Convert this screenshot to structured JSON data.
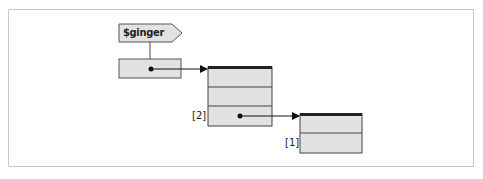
{
  "diagram": {
    "variable": {
      "label": "$ginger"
    },
    "arrays": [
      {
        "name": "outer-array",
        "rows": 3,
        "pointer_row_label": "[2]"
      },
      {
        "name": "inner-array",
        "rows": 2,
        "row_label": "[1]"
      }
    ],
    "colors": {
      "fill": "#e2e2e2",
      "stroke": "#333333",
      "frame": "#c8c8c8"
    }
  }
}
